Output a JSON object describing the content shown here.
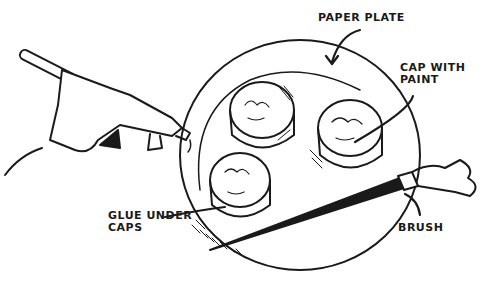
{
  "illustration": {
    "subject": "Painting setup: hot glue gun, paper plate with paint caps, and brush",
    "colors": {
      "ink": "#1a1a1a",
      "paper": "#ffffff"
    },
    "labels": {
      "paper_plate": "PAPER PLATE",
      "cap_with_paint": "CAP WITH\nPAINT",
      "glue_under_caps": "GLUE UNDER\nCAPS",
      "brush": "BRUSH"
    }
  }
}
